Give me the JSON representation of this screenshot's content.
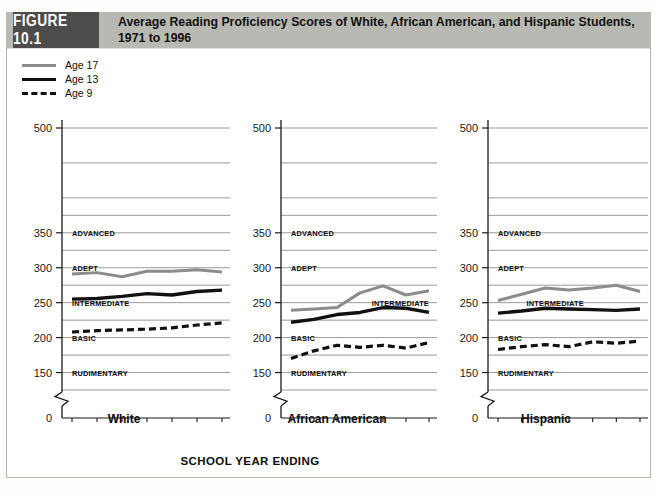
{
  "figure": {
    "badge": "FIGURE 10.1",
    "title": "Average Reading Proficiency Scores of White, African American, and Hispanic Students, 1971 to 1996",
    "footnote": "",
    "colors": {
      "badge_bg": "#4c4c4c",
      "header_bg": "#b9b9b4",
      "age17_line": "#8c8c8c",
      "age13_line": "#111111",
      "age9_line": "#111111",
      "gridline": "#8e8e8e"
    }
  },
  "legend": {
    "items": [
      {
        "label": "Age 17",
        "style": "solid",
        "color": "#8c8c8c",
        "width": 3
      },
      {
        "label": "Age 13",
        "style": "solid",
        "color": "#111111",
        "width": 3.4
      },
      {
        "label": "Age 9",
        "style": "dashed",
        "color": "#111111",
        "width": 3.2
      }
    ]
  },
  "axes": {
    "x_title": "SCHOOL YEAR ENDING",
    "y_tick_labels": [
      "500",
      "350",
      "300",
      "250",
      "200",
      "150",
      "0"
    ],
    "y_tick_values": [
      500,
      350,
      300,
      250,
      200,
      150,
      0
    ],
    "y_gridlines": [
      500,
      450,
      400,
      375,
      350,
      325,
      300,
      275,
      250,
      225,
      200,
      175,
      150,
      125
    ],
    "axis_break": true,
    "level_labels": [
      {
        "text": "ADVANCED",
        "value": 350
      },
      {
        "text": "ADEPT",
        "value": 300
      },
      {
        "text": "INTERMEDIATE",
        "value": 250
      },
      {
        "text": "BASIC",
        "value": 200
      },
      {
        "text": "RUDIMENTARY",
        "value": 150
      }
    ]
  },
  "chart_data": {
    "type": "line",
    "title": "Average Reading Proficiency Scores of White, African American, and Hispanic Students, 1971 to 1996",
    "xlabel": "SCHOOL YEAR ENDING",
    "ylabel": "",
    "ylim": [
      125,
      500
    ],
    "grid": true,
    "legend_position": "top-left",
    "categories": [
      "1971",
      "1975",
      "1980",
      "1984",
      "1988",
      "1992",
      "1996"
    ],
    "panels": [
      {
        "name": "White",
        "series": [
          {
            "name": "Age 17",
            "values": [
              291,
              293,
              287,
              295,
              295,
              297,
              294
            ]
          },
          {
            "name": "Age 13",
            "values": [
              255,
              256,
              259,
              263,
              261,
              266,
              268
            ]
          },
          {
            "name": "Age 9",
            "values": [
              208,
              210,
              211,
              212,
              214,
              218,
              221
            ]
          }
        ]
      },
      {
        "name": "African American",
        "series": [
          {
            "name": "Age 17",
            "values": [
              239,
              241,
              243,
              264,
              274,
              261,
              267
            ]
          },
          {
            "name": "Age 13",
            "values": [
              222,
              226,
              233,
              236,
              243,
              242,
              236
            ]
          },
          {
            "name": "Age 9",
            "values": [
              170,
              181,
              189,
              186,
              189,
              185,
              193
            ]
          }
        ]
      },
      {
        "name": "Hispanic",
        "series": [
          {
            "name": "Age 17",
            "values": [
              253,
              262,
              271,
              268,
              271,
              275,
              266
            ]
          },
          {
            "name": "Age 13",
            "values": [
              235,
              238,
              242,
              241,
              240,
              239,
              241
            ]
          },
          {
            "name": "Age 9",
            "values": [
              183,
              187,
              190,
              187,
              194,
              192,
              195
            ]
          }
        ]
      }
    ]
  }
}
